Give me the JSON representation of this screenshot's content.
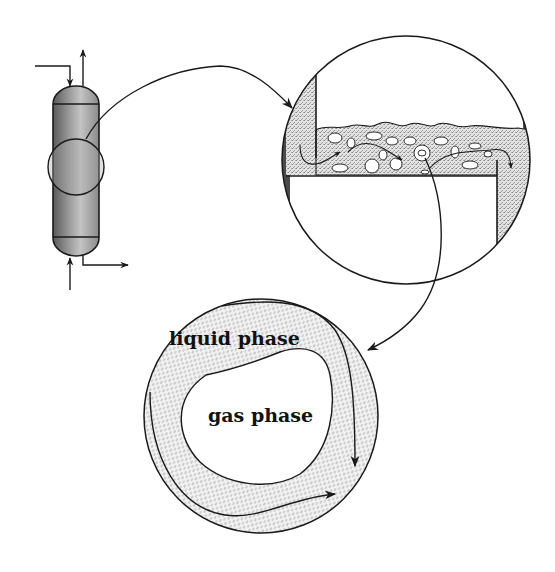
{
  "diagram": {
    "type": "process schematic",
    "components": {
      "vessel": {
        "name": "column vessel",
        "streams": [
          "top feed inlet",
          "top vapor outlet",
          "bottom gas inlet",
          "bottom liquid outlet"
        ]
      },
      "tray_detail": {
        "name": "tray detail magnification",
        "features": [
          "downcomer inlet weir",
          "froth with gas bubbles",
          "outlet weir",
          "tray deck"
        ]
      },
      "bubble_detail": {
        "name": "single bubble magnification"
      }
    },
    "labels": {
      "liquid": "liquid phase",
      "gas": "gas phase"
    },
    "colors": {
      "stroke": "#1a1a1a",
      "liquid_fill": "#d0d0d0",
      "vessel_dark": "#6e6e6e",
      "vessel_light": "#b8b8b8"
    }
  }
}
